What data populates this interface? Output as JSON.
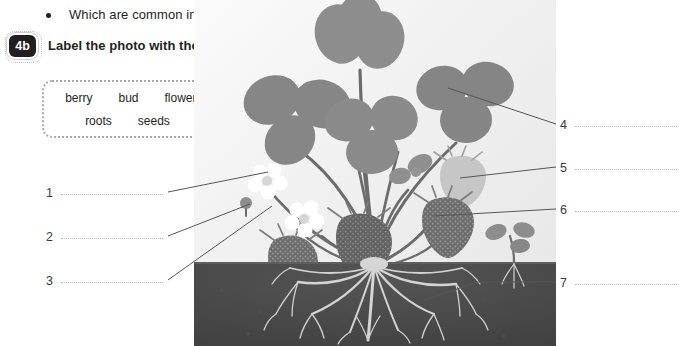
{
  "question": {
    "bullet_glyph": "•",
    "text": "Which are common in tropical rainforest habitats?"
  },
  "task": {
    "number": "4b",
    "instruction": "Label the photo with the words in the box."
  },
  "word_box": {
    "row1": [
      "berry",
      "bud",
      "flower",
      "leaf"
    ],
    "row2": [
      "roots",
      "seeds",
      "stem"
    ]
  },
  "answer_labels": {
    "left": [
      {
        "number": "1",
        "value": ""
      },
      {
        "number": "2",
        "value": ""
      },
      {
        "number": "3",
        "value": ""
      }
    ],
    "right": [
      {
        "number": "4",
        "value": ""
      },
      {
        "number": "5",
        "value": ""
      },
      {
        "number": "6",
        "value": ""
      },
      {
        "number": "7",
        "value": ""
      }
    ]
  },
  "illustration": {
    "subject": "strawberry-plant-cross-section",
    "description": "Grayscale photo of a strawberry plant showing leaves, flowers, a bud, ripe berries, a runner seedling and the root system below a dark soil block.",
    "colors": {
      "soil": "#4a4a4a",
      "leaf": "#8f8f8f",
      "leaf_dark": "#7a7a7a",
      "stem": "#6e6e6e",
      "berry": "#6b6b6b",
      "unripe_berry": "#bdbdbd",
      "flower": "#ffffff",
      "root": "#d9d9d9",
      "background": "#f2f2f2",
      "leader_line": "#55565a",
      "dotted_rule": "#b5b5b5"
    }
  }
}
